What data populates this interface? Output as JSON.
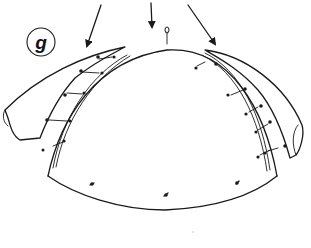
{
  "figure": {
    "panel_label": "g"
  },
  "arrows": [
    {
      "name": "left-arrow",
      "direction": "down-left"
    },
    {
      "name": "center-arrow",
      "direction": "down"
    },
    {
      "name": "right-arrow",
      "direction": "down-right"
    }
  ],
  "colors": {
    "ink": "#1a1a1a",
    "background": "#ffffff"
  }
}
